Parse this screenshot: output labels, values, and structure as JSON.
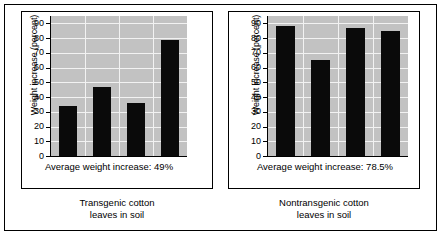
{
  "figure": {
    "background_color": "#ffffff",
    "frame_color": "#000000",
    "plot_background_color": "#c2c2c2",
    "bar_color": "#0a0a0a",
    "gridline_color": "#f2f2f2"
  },
  "panels": [
    {
      "id": "transgenic",
      "ylabel": "Weight increase (percent)",
      "avg_caption": "Average weight increase: 49%",
      "group_label_line1": "Transgenic cotton",
      "group_label_line2": "leaves in soil",
      "yticks": [
        "90",
        "80",
        "70",
        "60",
        "50",
        "40",
        "30",
        "20",
        "10",
        "0"
      ],
      "values": [
        34,
        47,
        36,
        79
      ]
    },
    {
      "id": "nontransgenic",
      "ylabel": "Weight increase (percent)",
      "avg_caption": "Average weight increase: 78.5%",
      "group_label_line1": "Nontransgenic cotton",
      "group_label_line2": "leaves in soil",
      "yticks": [
        "90",
        "80",
        "70",
        "60",
        "50",
        "40",
        "30",
        "20",
        "10",
        "0"
      ],
      "values": [
        88,
        65,
        87,
        85
      ]
    }
  ],
  "chart_data": {
    "type": "bar",
    "title": "",
    "subtitle": "",
    "xlabel": "",
    "ylabel": "Weight increase (percent)",
    "ylim": [
      0,
      95
    ],
    "yticks": [
      0,
      10,
      20,
      30,
      40,
      50,
      60,
      70,
      80,
      90
    ],
    "grid": true,
    "legend": "none",
    "panels": [
      {
        "name": "Transgenic cotton leaves in soil",
        "categories": [
          "1",
          "2",
          "3",
          "4"
        ],
        "values": [
          34,
          47,
          36,
          79
        ],
        "annotation": "Average weight increase: 49%",
        "average": 49
      },
      {
        "name": "Nontransgenic cotton leaves in soil",
        "categories": [
          "1",
          "2",
          "3",
          "4"
        ],
        "values": [
          88,
          65,
          87,
          85
        ],
        "annotation": "Average weight increase: 78.5%",
        "average": 78.5
      }
    ]
  }
}
